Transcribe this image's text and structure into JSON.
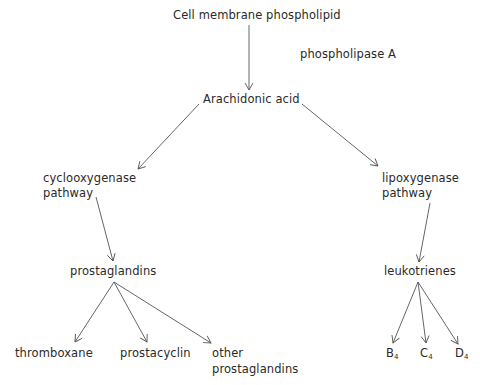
{
  "diagram": {
    "nodes": {
      "source": "Cell membrane phospholipid",
      "enzyme": "phospholipase A",
      "arachidonic": "Arachidonic acid",
      "cox_line1": "cyclooxygenase",
      "cox_line2": "pathway",
      "lox_line1": "lipoxygenase",
      "lox_line2": "pathway",
      "prostaglandins": "prostaglandins",
      "leukotrienes": "leukotrienes",
      "thromboxane": "thromboxane",
      "prostacyclin": "prostacyclin",
      "other_line1": "other",
      "other_line2": "prostaglandins",
      "b_letter": "B",
      "b_sub": "4",
      "c_letter": "C",
      "c_sub": "4",
      "d_letter": "D",
      "d_sub": "4"
    },
    "edges": [
      {
        "from": "Cell membrane phospholipid",
        "to": "Arachidonic acid"
      },
      {
        "from": "Arachidonic acid",
        "to": "cyclooxygenase pathway"
      },
      {
        "from": "Arachidonic acid",
        "to": "lipoxygenase pathway"
      },
      {
        "from": "cyclooxygenase pathway",
        "to": "prostaglandins"
      },
      {
        "from": "lipoxygenase pathway",
        "to": "leukotrienes"
      },
      {
        "from": "prostaglandins",
        "to": "thromboxane"
      },
      {
        "from": "prostaglandins",
        "to": "prostacyclin"
      },
      {
        "from": "prostaglandins",
        "to": "other prostaglandins"
      },
      {
        "from": "leukotrienes",
        "to": "B4"
      },
      {
        "from": "leukotrienes",
        "to": "C4"
      },
      {
        "from": "leukotrienes",
        "to": "D4"
      }
    ],
    "line_color": "#555555"
  }
}
